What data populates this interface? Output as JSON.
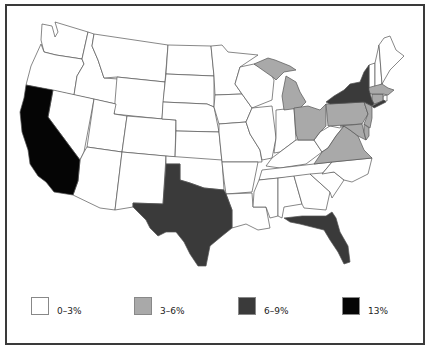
{
  "map": {
    "title": "",
    "region": "United States (contiguous)",
    "colors": {
      "0-3%": "#ffffff",
      "3-6%": "#a9a9a9",
      "6-9%": "#3a3a3a",
      "13%": "#050505",
      "border": "#555555",
      "frame": "#3a3a3a"
    },
    "states_by_category": {
      "13%": [
        "California"
      ],
      "6-9%": [
        "Texas",
        "Florida",
        "New York"
      ],
      "3-6%": [
        "Michigan",
        "Ohio",
        "Pennsylvania",
        "Virginia",
        "New Jersey",
        "Maryland",
        "Massachusetts",
        "Connecticut",
        "Delaware"
      ],
      "0-3%": [
        "All other states"
      ]
    }
  },
  "legend": {
    "items": [
      {
        "label": "0–3%",
        "color": "#ffffff"
      },
      {
        "label": "3–6%",
        "color": "#a9a9a9"
      },
      {
        "label": "6–9%",
        "color": "#3a3a3a"
      },
      {
        "label": "13%",
        "color": "#050505"
      }
    ]
  }
}
